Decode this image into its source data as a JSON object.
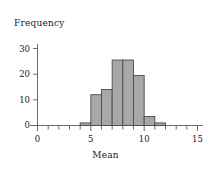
{
  "chart_data": {
    "type": "bar",
    "title": "",
    "xlabel": "Mean",
    "ylabel": "Frequency",
    "xlim": [
      0,
      15
    ],
    "ylim": [
      0,
      32
    ],
    "xticks": [
      0,
      5,
      10,
      15
    ],
    "xtick_labels": [
      "0",
      "5",
      "10",
      "15"
    ],
    "xminor_ticks": [
      1,
      2,
      3,
      4,
      6,
      7,
      8,
      9,
      11,
      12,
      13,
      14
    ],
    "yticks": [
      0,
      10,
      20,
      30
    ],
    "ytick_labels": [
      "0",
      "10",
      "20",
      "30"
    ],
    "grid": false,
    "legend": null,
    "bin_width": 1,
    "bins": [
      {
        "x0": 4,
        "x1": 5,
        "value": 1
      },
      {
        "x0": 5,
        "x1": 6,
        "value": 12
      },
      {
        "x0": 6,
        "x1": 7,
        "value": 14
      },
      {
        "x0": 7,
        "x1": 8,
        "value": 25.5
      },
      {
        "x0": 8,
        "x1": 9,
        "value": 25.5
      },
      {
        "x0": 9,
        "x1": 10,
        "value": 19.5
      },
      {
        "x0": 10,
        "x1": 11,
        "value": 3.5
      },
      {
        "x0": 11,
        "x1": 12,
        "value": 1
      }
    ],
    "categories": [
      "4-5",
      "5-6",
      "6-7",
      "7-8",
      "8-9",
      "9-10",
      "10-11",
      "11-12"
    ],
    "values": [
      1,
      12,
      14,
      25.5,
      25.5,
      19.5,
      3.5,
      1
    ],
    "colors": {
      "bar_fill": "#a8a8a8",
      "bar_stroke": "#4a4a4a",
      "axis": "#6b6b6b",
      "text": "#1a1a1a",
      "background": "#ffffff"
    }
  },
  "labels": {
    "ylabel": "Frequency",
    "xlabel": "Mean",
    "ytick_0": "0",
    "ytick_10": "10",
    "ytick_20": "20",
    "ytick_30": "30",
    "xtick_0": "0",
    "xtick_5": "5",
    "xtick_10": "10",
    "xtick_15": "15"
  }
}
